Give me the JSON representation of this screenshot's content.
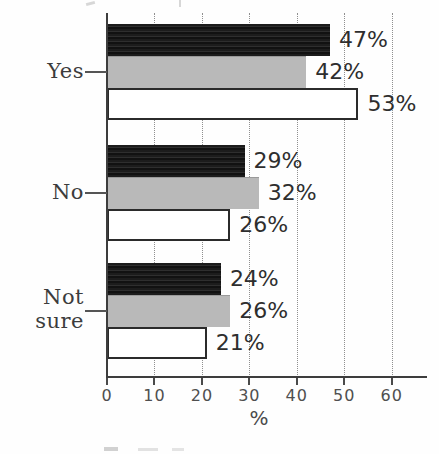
{
  "chart_data": {
    "type": "bar",
    "orientation": "horizontal",
    "categories": [
      "Yes",
      "No",
      "Not sure"
    ],
    "series": [
      {
        "name": "black",
        "color": "#1f1f1f",
        "values": [
          47,
          29,
          24
        ]
      },
      {
        "name": "gray",
        "color": "#b9b9b9",
        "values": [
          42,
          32,
          26
        ]
      },
      {
        "name": "white",
        "color": "#ffffff",
        "values": [
          53,
          26,
          21
        ]
      }
    ],
    "value_labels": [
      [
        "47%",
        "42%",
        "53%"
      ],
      [
        "29%",
        "32%",
        "26%"
      ],
      [
        "24%",
        "26%",
        "21%"
      ]
    ],
    "xlabel": "%",
    "x_ticks": [
      "0",
      "10",
      "20",
      "30",
      "40",
      "50",
      "60"
    ],
    "xlim": [
      0,
      67.5
    ],
    "grid": "vertical-dotted",
    "legend_position": "cut-off-at-bottom-edge"
  }
}
